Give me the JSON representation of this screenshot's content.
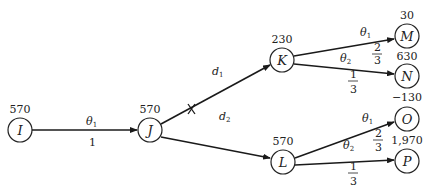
{
  "diagram": {
    "type": "decision-tree",
    "nodes": [
      {
        "id": "I",
        "label": "I",
        "value": "570",
        "x": 20,
        "y": 130
      },
      {
        "id": "J",
        "label": "J",
        "value": "570",
        "x": 150,
        "y": 130
      },
      {
        "id": "K",
        "label": "K",
        "value": "230",
        "x": 282,
        "y": 60
      },
      {
        "id": "L",
        "label": "L",
        "value": "570",
        "x": 283,
        "y": 162
      },
      {
        "id": "M",
        "label": "M",
        "value": "30",
        "x": 407,
        "y": 36
      },
      {
        "id": "N",
        "label": "N",
        "value": "630",
        "x": 407,
        "y": 76
      },
      {
        "id": "O",
        "label": "O",
        "value": "−130",
        "x": 407,
        "y": 119
      },
      {
        "id": "P",
        "label": "P",
        "value": "1,970",
        "x": 407,
        "y": 161
      }
    ],
    "edges": [
      {
        "from": "I",
        "to": "J",
        "label": "θ",
        "label_sub": "1",
        "prob": "1"
      },
      {
        "from": "J",
        "to": "K",
        "label": "d",
        "label_sub": "1",
        "cut": true
      },
      {
        "from": "J",
        "to": "L",
        "label": "d",
        "label_sub": "2"
      },
      {
        "from": "K",
        "to": "M",
        "label": "θ",
        "label_sub": "1",
        "prob_num": "2",
        "prob_den": "3"
      },
      {
        "from": "K",
        "to": "N",
        "label": "θ",
        "label_sub": "2",
        "prob_num": "1",
        "prob_den": "3"
      },
      {
        "from": "L",
        "to": "O",
        "label": "θ",
        "label_sub": "1",
        "prob_num": "2",
        "prob_den": "3"
      },
      {
        "from": "L",
        "to": "P",
        "label": "θ",
        "label_sub": "2",
        "prob_num": "1",
        "prob_den": "3"
      }
    ]
  }
}
